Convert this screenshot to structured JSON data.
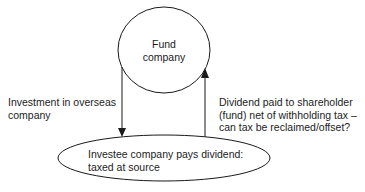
{
  "diagram": {
    "nodes": {
      "fund": {
        "shape": "circle",
        "lines": [
          "Fund",
          "company"
        ]
      },
      "investee": {
        "shape": "ellipse",
        "lines": [
          "Investee company pays dividend:",
          "taxed at source"
        ]
      }
    },
    "edges": {
      "investment": {
        "from": "fund",
        "to": "investee",
        "lines": [
          "Investment in overseas",
          "company"
        ]
      },
      "dividend": {
        "from": "investee",
        "to": "fund",
        "lines": [
          "Dividend paid to shareholder",
          "(fund) net of withholding tax –",
          "can tax be reclaimed/offset?"
        ]
      }
    },
    "colors": {
      "stroke": "#1a1a1a",
      "background": "#ffffff"
    }
  }
}
